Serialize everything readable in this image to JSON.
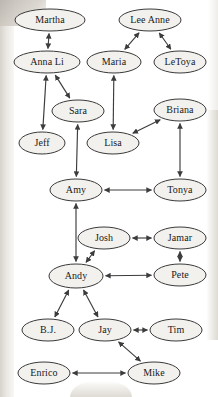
{
  "diagram": {
    "node_fill": "#f2f1ee",
    "node_stroke": "#3a3a3a",
    "edge_color": "#3c3c3c",
    "background": "#ffffff",
    "width": 218,
    "height": 397,
    "nodes": [
      {
        "id": "martha",
        "label": "Martha",
        "cx": 50,
        "cy": 20,
        "rx": 35,
        "ry": 11
      },
      {
        "id": "leeanne",
        "label": "Lee Anne",
        "cx": 150,
        "cy": 20,
        "rx": 31,
        "ry": 11
      },
      {
        "id": "annali",
        "label": "Anna Li",
        "cx": 47,
        "cy": 62,
        "rx": 33,
        "ry": 11
      },
      {
        "id": "maria",
        "label": "Maria",
        "cx": 114,
        "cy": 62,
        "rx": 27,
        "ry": 11
      },
      {
        "id": "letoya",
        "label": "LeToya",
        "cx": 180,
        "cy": 62,
        "rx": 26,
        "ry": 11
      },
      {
        "id": "sara",
        "label": "Sara",
        "cx": 78,
        "cy": 111,
        "rx": 26,
        "ry": 11
      },
      {
        "id": "briana",
        "label": "Briana",
        "cx": 180,
        "cy": 110,
        "rx": 26,
        "ry": 11
      },
      {
        "id": "jeff",
        "label": "Jeff",
        "cx": 42,
        "cy": 143,
        "rx": 23,
        "ry": 11
      },
      {
        "id": "lisa",
        "label": "Lisa",
        "cx": 113,
        "cy": 143,
        "rx": 26,
        "ry": 11
      },
      {
        "id": "amy",
        "label": "Amy",
        "cx": 76,
        "cy": 190,
        "rx": 26,
        "ry": 11
      },
      {
        "id": "tonya",
        "label": "Tonya",
        "cx": 180,
        "cy": 190,
        "rx": 26,
        "ry": 11
      },
      {
        "id": "josh",
        "label": "Josh",
        "cx": 104,
        "cy": 238,
        "rx": 26,
        "ry": 11
      },
      {
        "id": "jamar",
        "label": "Jamar",
        "cx": 180,
        "cy": 238,
        "rx": 26,
        "ry": 11
      },
      {
        "id": "andy",
        "label": "Andy",
        "cx": 76,
        "cy": 276,
        "rx": 27,
        "ry": 12
      },
      {
        "id": "pete",
        "label": "Pete",
        "cx": 180,
        "cy": 275,
        "rx": 26,
        "ry": 11
      },
      {
        "id": "bj",
        "label": "B.J.",
        "cx": 48,
        "cy": 330,
        "rx": 26,
        "ry": 11
      },
      {
        "id": "jay",
        "label": "Jay",
        "cx": 105,
        "cy": 330,
        "rx": 26,
        "ry": 11
      },
      {
        "id": "tim",
        "label": "Tim",
        "cx": 176,
        "cy": 330,
        "rx": 26,
        "ry": 11
      },
      {
        "id": "enrico",
        "label": "Enrico",
        "cx": 44,
        "cy": 373,
        "rx": 26,
        "ry": 11
      },
      {
        "id": "mike",
        "label": "Mike",
        "cx": 154,
        "cy": 373,
        "rx": 26,
        "ry": 11
      }
    ],
    "edges": [
      {
        "from": "martha",
        "to": "annali",
        "type": "double"
      },
      {
        "from": "leeanne",
        "to": "maria",
        "type": "double"
      },
      {
        "from": "leeanne",
        "to": "letoya",
        "type": "double"
      },
      {
        "from": "annali",
        "to": "sara",
        "type": "double"
      },
      {
        "from": "annali",
        "to": "jeff",
        "type": "double"
      },
      {
        "from": "maria",
        "to": "lisa",
        "type": "double"
      },
      {
        "from": "sara",
        "to": "amy",
        "type": "double"
      },
      {
        "from": "lisa",
        "to": "briana",
        "type": "double"
      },
      {
        "from": "briana",
        "to": "tonya",
        "type": "double"
      },
      {
        "from": "amy",
        "to": "tonya",
        "type": "double"
      },
      {
        "from": "amy",
        "to": "andy",
        "type": "double"
      },
      {
        "from": "josh",
        "to": "jamar",
        "type": "double"
      },
      {
        "from": "josh",
        "to": "andy",
        "type": "double"
      },
      {
        "from": "jamar",
        "to": "pete",
        "type": "double"
      },
      {
        "from": "andy",
        "to": "pete",
        "type": "double"
      },
      {
        "from": "andy",
        "to": "bj",
        "type": "double"
      },
      {
        "from": "andy",
        "to": "jay",
        "type": "double"
      },
      {
        "from": "jay",
        "to": "tim",
        "type": "double"
      },
      {
        "from": "jay",
        "to": "mike",
        "type": "double"
      },
      {
        "from": "enrico",
        "to": "mike",
        "type": "double"
      }
    ]
  }
}
